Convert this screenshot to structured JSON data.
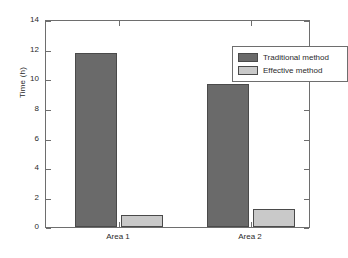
{
  "chart_data": {
    "type": "bar",
    "title": "",
    "xlabel": "",
    "ylabel": "Time (h)",
    "categories": [
      "Area 1",
      "Area 2"
    ],
    "series": [
      {
        "name": "Traditional method",
        "values": [
          11.8,
          9.7
        ],
        "color": "#6a6a6a"
      },
      {
        "name": "Effective method",
        "values": [
          0.8,
          1.2
        ],
        "color": "#c9c9c9"
      }
    ],
    "ylim": [
      0,
      14
    ],
    "yticks": [
      0,
      2,
      4,
      6,
      8,
      10,
      12,
      14
    ],
    "ytick_labels": [
      "0",
      "2",
      "4",
      "6",
      "8",
      "10",
      "12",
      "14"
    ],
    "grid": false,
    "legend_position": "top-right",
    "background": "#ffffff",
    "axis_color": "#6e6e6e"
  },
  "axes": {
    "y_title": "Time (h)",
    "tick_labels_y": [
      "0",
      "2",
      "4",
      "6",
      "8",
      "10",
      "12",
      "14"
    ],
    "tick_labels_x": [
      "Area 1",
      "Area 2"
    ]
  },
  "legend": {
    "entries": [
      {
        "label": "Traditional method"
      },
      {
        "label": "Effective method"
      }
    ]
  }
}
